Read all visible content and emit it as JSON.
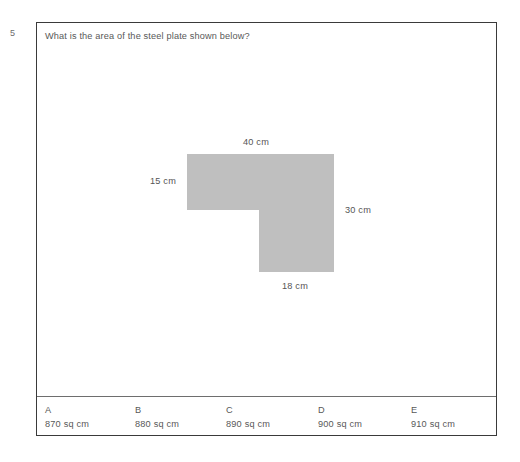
{
  "question": {
    "number": "5",
    "text": "What is the area of the steel plate shown below?"
  },
  "figure": {
    "shape_name": "steel-plate-l-shape",
    "fill_color": "#bfbfbf",
    "dimensions": {
      "top": "40 cm",
      "left": "15 cm",
      "right": "30 cm",
      "bottom": "18 cm"
    }
  },
  "answers": [
    {
      "letter": "A",
      "value": "870 sq cm"
    },
    {
      "letter": "B",
      "value": "880 sq cm"
    },
    {
      "letter": "C",
      "value": "890 sq cm"
    },
    {
      "letter": "D",
      "value": "900 sq cm"
    },
    {
      "letter": "E",
      "value": "910 sq cm"
    }
  ]
}
